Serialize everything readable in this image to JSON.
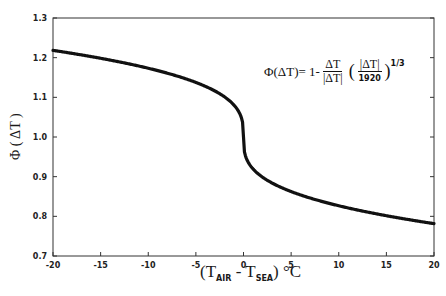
{
  "chart_data": {
    "type": "line",
    "title": "",
    "xlabel": "(T_AIR - T_SEA) °C",
    "ylabel": "Φ (ΔT)",
    "xlim": [
      -20,
      20
    ],
    "ylim": [
      0.7,
      1.3
    ],
    "xticks": [
      -20,
      -15,
      -10,
      -5,
      0,
      5,
      10,
      15,
      20
    ],
    "yticks": [
      0.7,
      0.8,
      0.9,
      1.0,
      1.1,
      1.2,
      1.3
    ],
    "grid": false,
    "annotation": "Φ(ΔT) = 1 - ΔT/|ΔT| (|ΔT|/1920)^(1/3)",
    "series": [
      {
        "name": "Φ(ΔT)",
        "x": [
          -20,
          -17.5,
          -15,
          -12.5,
          -10,
          -7.5,
          -5,
          -3,
          -2,
          -1,
          -0.5,
          -0.2,
          -0.05,
          0,
          0.05,
          0.2,
          0.5,
          1,
          2,
          3,
          5,
          7.5,
          10,
          12.5,
          15,
          17.5,
          20
        ],
        "y": [
          1.218,
          1.209,
          1.198,
          1.187,
          1.173,
          1.158,
          1.138,
          1.116,
          1.101,
          1.08,
          1.064,
          1.047,
          1.03,
          1.0,
          0.97,
          0.953,
          0.936,
          0.92,
          0.899,
          0.884,
          0.862,
          0.842,
          0.827,
          0.813,
          0.802,
          0.791,
          0.782
        ]
      }
    ]
  },
  "labels": {
    "phi": "Φ",
    "eq": "(ΔT)= 1-",
    "frac1_num": "ΔT",
    "frac1_den": "|ΔT|",
    "frac2_num": "|ΔT|",
    "frac2_den": "1920",
    "exponent": "1/3",
    "x_T": "T",
    "x_air": "AIR",
    "x_minus": " - T",
    "x_sea": "SEA",
    "x_unit": ") °C",
    "x_open": "(",
    "y_label": "Φ ( ΔT )"
  }
}
